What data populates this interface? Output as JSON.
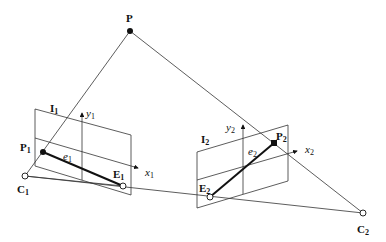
{
  "figure": {
    "points": {
      "P": {
        "label": "P",
        "sub": ""
      },
      "P1": {
        "label": "P",
        "sub": "1"
      },
      "P2": {
        "label": "P",
        "sub": "2"
      },
      "C1": {
        "label": "C",
        "sub": "1"
      },
      "C2": {
        "label": "C",
        "sub": "2"
      },
      "E1": {
        "label": "E",
        "sub": "1"
      },
      "E2": {
        "label": "E",
        "sub": "2"
      }
    },
    "planes": {
      "I1": {
        "label": "I",
        "sub": "1"
      },
      "I2": {
        "label": "I",
        "sub": "2"
      }
    },
    "axes": {
      "x1": {
        "label": "x",
        "sub": "1"
      },
      "y1": {
        "label": "y",
        "sub": "1"
      },
      "x2": {
        "label": "x",
        "sub": "2"
      },
      "y2": {
        "label": "y",
        "sub": "2"
      }
    },
    "epipolar_lines": {
      "e1": {
        "label": "e",
        "sub": "1"
      },
      "e2": {
        "label": "e",
        "sub": "2"
      }
    }
  }
}
